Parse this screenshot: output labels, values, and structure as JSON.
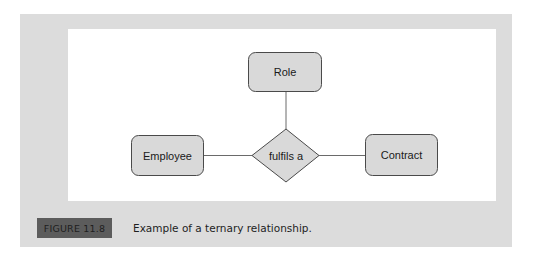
{
  "figure": {
    "label": "FIGURE 11.8",
    "caption": "Example of a ternary relationship."
  },
  "diagram": {
    "type": "ER ternary relationship",
    "entities": [
      {
        "id": "role",
        "label": "Role"
      },
      {
        "id": "employee",
        "label": "Employee"
      },
      {
        "id": "contract",
        "label": "Contract"
      }
    ],
    "relationship": {
      "id": "fulfils",
      "label": "fulfils a"
    },
    "connections": [
      {
        "from": "role",
        "to": "fulfils"
      },
      {
        "from": "employee",
        "to": "fulfils"
      },
      {
        "from": "contract",
        "to": "fulfils"
      }
    ],
    "colors": {
      "panel": "#dcdcdc",
      "canvas": "#ffffff",
      "shape_fill": "#d9d9d9",
      "shape_stroke": "#4a4a4a",
      "line": "#6a6a6a",
      "label_box": "#5c5c5c"
    }
  }
}
